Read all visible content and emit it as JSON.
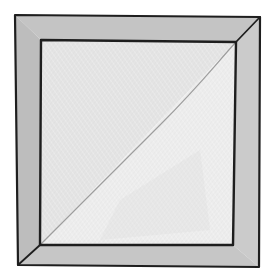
{
  "illustration": {
    "subject": "quilt-block-half-square-triangle-with-border",
    "colors": {
      "background": "#ffffff",
      "border_fill": "#bfbfbf",
      "border_fill_light": "#c9c9c9",
      "upper_left_triangle": "#e4e4e4",
      "lower_right_triangle": "#ececec",
      "seam_line": "#8c8c8c",
      "outline": "#1e1e1e"
    },
    "outer_square": {
      "top_left": [
        15,
        15
      ],
      "top_right": [
        260,
        17
      ],
      "bottom_right": [
        259,
        267
      ],
      "bottom_left": [
        18,
        265
      ]
    },
    "inner_square": {
      "top_left": [
        41,
        40
      ],
      "top_right": [
        236,
        42
      ],
      "bottom_right": [
        233,
        245
      ],
      "bottom_left": [
        40,
        245
      ]
    }
  }
}
